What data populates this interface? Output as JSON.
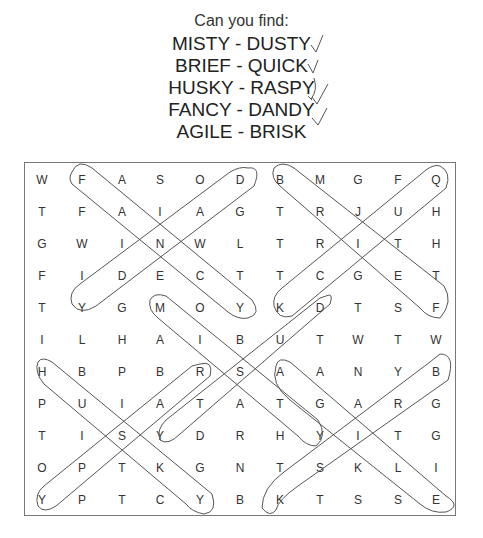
{
  "header": {
    "title": "Can you find:",
    "pairs": [
      {
        "label": "MISTY - DUSTY",
        "checked": true
      },
      {
        "label": "BRIEF - QUICK",
        "checked": true
      },
      {
        "label": "HUSKY - RASPY",
        "checked": true
      },
      {
        "label": "FANCY - DANDY",
        "checked": true
      },
      {
        "label": "AGILE - BRISK",
        "checked": true
      }
    ],
    "check_icon": "checkmark-icon"
  },
  "grid": {
    "rows": [
      [
        "W",
        "F",
        "A",
        "S",
        "O",
        "D",
        "B",
        "M",
        "G",
        "F",
        "Q"
      ],
      [
        "T",
        "F",
        "A",
        "I",
        "A",
        "G",
        "T",
        "R",
        "J",
        "U",
        "H"
      ],
      [
        "G",
        "W",
        "I",
        "N",
        "W",
        "L",
        "T",
        "R",
        "I",
        "T",
        "H"
      ],
      [
        "F",
        "I",
        "D",
        "E",
        "C",
        "T",
        "T",
        "C",
        "G",
        "E",
        "T"
      ],
      [
        "T",
        "Y",
        "G",
        "M",
        "O",
        "Y",
        "K",
        "D",
        "T",
        "S",
        "F"
      ],
      [
        "I",
        "L",
        "H",
        "A",
        "I",
        "B",
        "U",
        "T",
        "W",
        "T",
        "W"
      ],
      [
        "H",
        "B",
        "P",
        "B",
        "R",
        "S",
        "A",
        "A",
        "N",
        "Y",
        "B"
      ],
      [
        "P",
        "U",
        "I",
        "A",
        "T",
        "A",
        "T",
        "G",
        "A",
        "R",
        "G"
      ],
      [
        "T",
        "I",
        "S",
        "Y",
        "D",
        "R",
        "H",
        "Y",
        "I",
        "T",
        "G"
      ],
      [
        "O",
        "P",
        "T",
        "K",
        "G",
        "N",
        "T",
        "S",
        "K",
        "L",
        "I"
      ],
      [
        "Y",
        "P",
        "T",
        "C",
        "Y",
        "B",
        "K",
        "T",
        "S",
        "S",
        "E"
      ]
    ],
    "found_words": [
      "FANCY",
      "DANDY",
      "BRIEF",
      "QUICK",
      "MISTY",
      "DUSTY",
      "HUSKY",
      "RASPY",
      "AGILE",
      "BRISK"
    ],
    "circle_color": "#555555"
  }
}
